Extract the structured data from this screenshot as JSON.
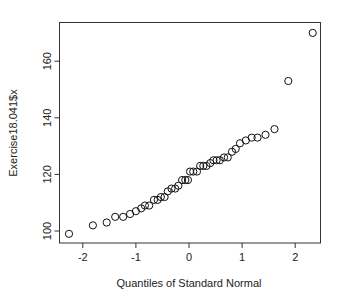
{
  "chart_data": {
    "type": "scatter",
    "subtype": "normal-qq-plot",
    "title": "",
    "xlabel": "Quantiles of Standard Normal",
    "ylabel": "Exercise18.041$x",
    "xlim": [
      -2.45,
      2.45
    ],
    "ylim": [
      96.5,
      173
    ],
    "xticks": [
      -2,
      -1,
      0,
      1,
      2
    ],
    "xtick_labels": [
      "-2",
      "-1",
      "0",
      "1",
      "2"
    ],
    "yticks": [
      100,
      120,
      140,
      160
    ],
    "ytick_labels": [
      "100",
      "120",
      "140",
      "160"
    ],
    "grid": false,
    "legend": null,
    "marker": "open-circle",
    "points": [
      {
        "x": -2.26,
        "y": 99
      },
      {
        "x": -1.81,
        "y": 102
      },
      {
        "x": -1.55,
        "y": 103
      },
      {
        "x": -1.39,
        "y": 105
      },
      {
        "x": -1.24,
        "y": 105
      },
      {
        "x": -1.11,
        "y": 106
      },
      {
        "x": -1.0,
        "y": 107
      },
      {
        "x": -0.9,
        "y": 108
      },
      {
        "x": -0.83,
        "y": 109
      },
      {
        "x": -0.75,
        "y": 109
      },
      {
        "x": -0.66,
        "y": 111
      },
      {
        "x": -0.59,
        "y": 111
      },
      {
        "x": -0.53,
        "y": 112
      },
      {
        "x": -0.46,
        "y": 112
      },
      {
        "x": -0.4,
        "y": 114
      },
      {
        "x": -0.33,
        "y": 115
      },
      {
        "x": -0.26,
        "y": 115
      },
      {
        "x": -0.2,
        "y": 116
      },
      {
        "x": -0.13,
        "y": 118
      },
      {
        "x": -0.07,
        "y": 118
      },
      {
        "x": -0.02,
        "y": 118
      },
      {
        "x": 0.02,
        "y": 121
      },
      {
        "x": 0.08,
        "y": 121
      },
      {
        "x": 0.15,
        "y": 121
      },
      {
        "x": 0.21,
        "y": 123
      },
      {
        "x": 0.27,
        "y": 123
      },
      {
        "x": 0.33,
        "y": 123
      },
      {
        "x": 0.4,
        "y": 124
      },
      {
        "x": 0.46,
        "y": 125
      },
      {
        "x": 0.52,
        "y": 125
      },
      {
        "x": 0.58,
        "y": 125
      },
      {
        "x": 0.66,
        "y": 126
      },
      {
        "x": 0.73,
        "y": 126
      },
      {
        "x": 0.81,
        "y": 128
      },
      {
        "x": 0.88,
        "y": 129
      },
      {
        "x": 0.96,
        "y": 131
      },
      {
        "x": 1.07,
        "y": 132
      },
      {
        "x": 1.18,
        "y": 133
      },
      {
        "x": 1.29,
        "y": 133
      },
      {
        "x": 1.44,
        "y": 134
      },
      {
        "x": 1.61,
        "y": 136
      },
      {
        "x": 1.87,
        "y": 153
      },
      {
        "x": 2.33,
        "y": 170
      }
    ]
  },
  "colors": {
    "background": "#ffffff",
    "axis": "#333333",
    "marker_stroke": "#111111"
  }
}
